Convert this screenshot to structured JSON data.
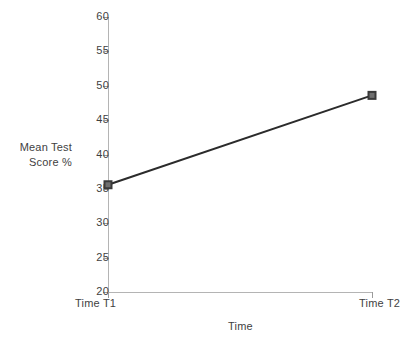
{
  "chart_data": {
    "type": "line",
    "title": "",
    "xlabel": "Time",
    "ylabel": "Mean Test Score %",
    "ylabel_lines": [
      "Mean Test",
      "Score %"
    ],
    "categories": [
      "Time T1",
      "Time T2"
    ],
    "values": [
      35.6,
      48.6
    ],
    "series": [
      {
        "name": "Mean Test Score %",
        "values": [
          35.6,
          48.6
        ],
        "color": "#2b2b2b",
        "marker": "square",
        "marker_color": "#3a3a3a"
      }
    ],
    "ylim": [
      20,
      60
    ],
    "yticks": [
      20,
      25,
      30,
      35,
      40,
      45,
      50,
      55,
      60
    ],
    "ytick_labels": [
      "20",
      "25",
      "30",
      "35",
      "40",
      "45",
      "50",
      "55",
      "60"
    ],
    "xtick_labels": [
      "Time T1",
      "Time T2"
    ],
    "grid": false,
    "legend": false,
    "legend_position": "none",
    "axis_color": "#b4b4b4",
    "tick_color": "#9a9a9a",
    "text_color": "#3f3f3f",
    "background": "#ffffff"
  }
}
